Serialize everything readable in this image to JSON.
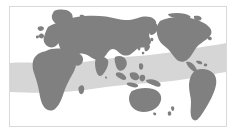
{
  "figure": {
    "kind": "world-map",
    "title": "",
    "caption": "",
    "projection": "equirectangular",
    "center_longitude": 20,
    "antarctica_shown": false,
    "border_color": "#d9d9d9",
    "background_color": "#ffffff"
  },
  "legend": {
    "visible": false,
    "entries": [
      {
        "key": "land",
        "label": "Land",
        "color": "#808080"
      },
      {
        "key": "range-band",
        "label": "Distribution band",
        "color": "#d6d6d6"
      },
      {
        "key": "ocean",
        "label": "Ocean",
        "color": "#ffffff"
      }
    ]
  },
  "layers": {
    "ocean": {
      "name": "ocean",
      "color": "#ffffff"
    },
    "land": {
      "name": "landmass",
      "color": "#808080",
      "regions": [
        "Eurasia",
        "Africa",
        "North America",
        "South America",
        "Australia",
        "New Zealand",
        "Indonesia",
        "Japan",
        "Greenland",
        "British Isles",
        "Madagascar",
        "Arabian Peninsula",
        "India",
        "Central America",
        "Caribbean"
      ]
    },
    "band": {
      "name": "tropical-distribution-band",
      "color": "#d6d6d6",
      "opacity": 1,
      "description": "Shaded latitudinal band sweeping across the tropics, dipping lower over the Atlantic/Indian Ocean sector and rising over the Pacific and the Americas"
    }
  },
  "axes": {
    "visible": false,
    "latitude_labels": [],
    "longitude_labels": []
  },
  "annotations": [],
  "icons": {
    "compass": "compass-icon",
    "scale_bar": "scale-bar-icon"
  },
  "colors": {
    "land": "#808080",
    "band": "#d6d6d6",
    "ocean": "#ffffff",
    "frame": "#d9d9d9",
    "page": "#ffffff"
  }
}
